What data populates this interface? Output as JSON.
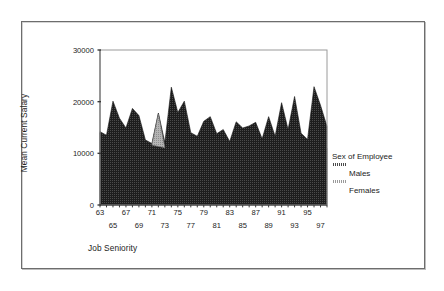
{
  "figure": {
    "background_color": "#ffffff",
    "border_color": "#6d6d6d"
  },
  "legend": {
    "title": "Sex of Employee",
    "entries": [
      {
        "label": "Males",
        "color": "#2b2b2b"
      },
      {
        "label": "Females",
        "color": "#9a9a9a"
      }
    ]
  },
  "chart_data": {
    "type": "area",
    "title": "",
    "xlabel": "Job Seniority",
    "ylabel": "Mean Current Salary",
    "xlim": [
      63,
      98
    ],
    "ylim": [
      0,
      30000
    ],
    "yticks": [
      0,
      10000,
      20000,
      30000
    ],
    "ytick_labels": [
      "0",
      "10000",
      "20000",
      "30000"
    ],
    "grid": false,
    "legend_position": "right",
    "xtick_labels_upper": [
      "63",
      "67",
      "71",
      "75",
      "79",
      "83",
      "87",
      "91",
      "95"
    ],
    "xtick_labels_lower": [
      "65",
      "69",
      "73",
      "77",
      "81",
      "85",
      "89",
      "93",
      "97"
    ],
    "xtick_upper_values": [
      63,
      67,
      71,
      75,
      79,
      83,
      87,
      91,
      95
    ],
    "xtick_lower_values": [
      65,
      69,
      73,
      77,
      81,
      85,
      89,
      93,
      97
    ],
    "x": [
      63,
      64,
      65,
      66,
      67,
      68,
      69,
      70,
      71,
      72,
      73,
      74,
      75,
      76,
      77,
      78,
      79,
      80,
      81,
      82,
      83,
      84,
      85,
      86,
      87,
      88,
      89,
      90,
      91,
      92,
      93,
      94,
      95,
      96,
      97,
      98
    ],
    "series": [
      {
        "name": "Males",
        "color": "#2b2b2b",
        "values": [
          14200,
          13500,
          20100,
          16800,
          14900,
          18700,
          17300,
          12600,
          11900,
          17800,
          12100,
          22800,
          17900,
          20100,
          14000,
          13300,
          16200,
          17100,
          13800,
          14600,
          12300,
          16100,
          14900,
          15300,
          16000,
          12800,
          17100,
          13300,
          19800,
          14600,
          21000,
          13900,
          12700,
          22900,
          19300,
          15200
        ]
      },
      {
        "name": "Females",
        "color": "#9a9a9a",
        "values": [
          13900,
          9900,
          10600,
          13100,
          12200,
          10200,
          8800,
          7800,
          11600,
          17600,
          11100,
          10500,
          12800,
          11200,
          9900,
          10900,
          11300,
          10800,
          9800,
          11600,
          10200,
          11800,
          12600,
          11900,
          12200,
          10100,
          11700,
          9700,
          10800,
          8900,
          11500,
          10600,
          9800,
          11200,
          10400,
          11000
        ]
      }
    ]
  }
}
